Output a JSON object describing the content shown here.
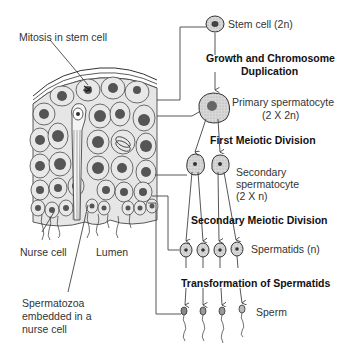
{
  "diagram": {
    "tissue_labels": {
      "mitosis": "Mitosis in stem cell",
      "nurse_cell": "Nurse cell",
      "lumen": "Lumen",
      "spermatozoa_line1": "Spermatozoa",
      "spermatozoa_line2": "embedded in a",
      "spermatozoa_line3": "nurse cell"
    },
    "cells": {
      "stem": "Stem cell (2n)",
      "primary_line1": "Primary spermatocyte",
      "primary_line2": "(2 X 2n)",
      "secondary_line1": "Secondary",
      "secondary_line2": "spermatocyte",
      "secondary_line3": "(2 X n)",
      "spermatids": "Spermatids (n)",
      "sperm": "Sperm"
    },
    "stages": {
      "growth_line1": "Growth and Chromosome",
      "growth_line2": "Duplication",
      "first_meiotic": "First Meiotic Division",
      "second_meiotic": "Secondary Meiotic Division",
      "transformation": "Transformation of Spermatids"
    },
    "colors": {
      "line": "#444444",
      "cell_fill": "#c8c8c8",
      "nucleus": "#555555",
      "tissue": "#dddddd"
    }
  }
}
